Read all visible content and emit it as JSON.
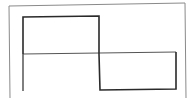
{
  "diagram": {
    "waveform": {
      "type": "square-wave",
      "segments": [
        {
          "name": "positive-pulse",
          "level": 1,
          "from": 0,
          "to": 0.5
        },
        {
          "name": "negative-pulse",
          "level": -1,
          "from": 0.5,
          "to": 1.0
        }
      ]
    },
    "colors": {
      "frame": "#8a8a8a",
      "axis": "#555555",
      "waveform": "#2a2a2a",
      "background": "#ffffff"
    }
  }
}
